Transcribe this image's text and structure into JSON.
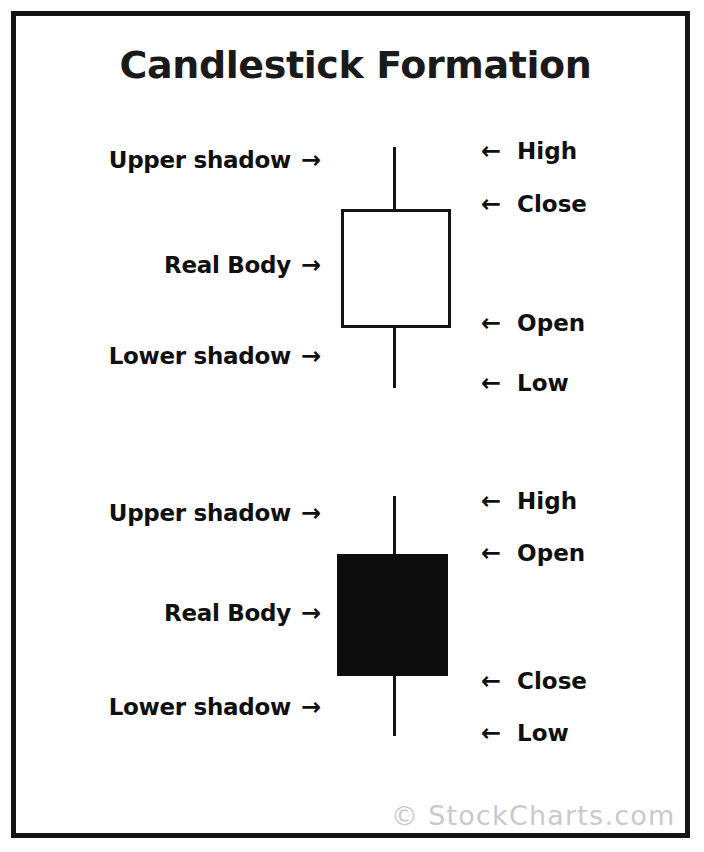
{
  "title": "Candlestick Formation",
  "watermark": {
    "copyright_symbol": "©",
    "text": "StockCharts.com"
  },
  "icons": {
    "arrow_right": "→",
    "arrow_left": "←"
  },
  "colors": {
    "ink": "#141414",
    "background": "#ffffff",
    "hollow_body_fill": "#ffffff",
    "filled_body_fill": "#0d0d0d",
    "watermark": "#c9c9c9"
  },
  "candles": [
    {
      "id": "bullish-white-candle",
      "body_style": "hollow",
      "left_labels": [
        {
          "name": "upper-shadow",
          "text": "Upper shadow"
        },
        {
          "name": "real-body",
          "text": "Real Body"
        },
        {
          "name": "lower-shadow",
          "text": "Lower shadow"
        }
      ],
      "right_labels": [
        {
          "name": "high",
          "text": "High"
        },
        {
          "name": "close",
          "text": "Close"
        },
        {
          "name": "open",
          "text": "Open"
        },
        {
          "name": "low",
          "text": "Low"
        }
      ]
    },
    {
      "id": "bearish-black-candle",
      "body_style": "filled",
      "left_labels": [
        {
          "name": "upper-shadow",
          "text": "Upper shadow"
        },
        {
          "name": "real-body",
          "text": "Real Body"
        },
        {
          "name": "lower-shadow",
          "text": "Lower shadow"
        }
      ],
      "right_labels": [
        {
          "name": "high",
          "text": "High"
        },
        {
          "name": "open",
          "text": "Open"
        },
        {
          "name": "close",
          "text": "Close"
        },
        {
          "name": "low",
          "text": "Low"
        }
      ]
    }
  ]
}
